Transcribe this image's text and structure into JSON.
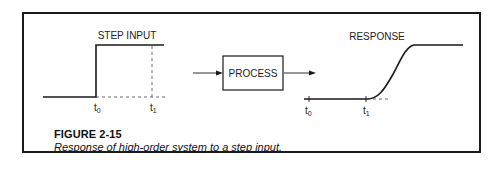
{
  "figure": {
    "number": "FIGURE 2-15",
    "caption": "Response of high-order system to a step input."
  },
  "diagram": {
    "input_label": "STEP INPUT",
    "process_label": "PROCESS",
    "output_label": "RESPONSE",
    "input_ticks": [
      {
        "base": "t",
        "sub": "0"
      },
      {
        "base": "t",
        "sub": "1"
      }
    ],
    "output_ticks": [
      {
        "base": "t",
        "sub": "0"
      },
      {
        "base": "t",
        "sub": "1"
      }
    ],
    "line_color": "#1a1a1a"
  }
}
